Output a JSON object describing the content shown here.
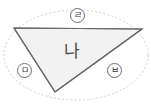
{
  "figure": {
    "type": "geometry-diagram",
    "background_color": "#ffffff",
    "center_label": "나",
    "triangle": {
      "fill_color": "#f2f2f2",
      "stroke_color": "#555555",
      "vertices": [
        {
          "name": "left-vertex",
          "x": 14,
          "y": 28
        },
        {
          "name": "right-vertex",
          "x": 142,
          "y": 29
        },
        {
          "name": "bottom-vertex",
          "x": 55,
          "y": 92
        }
      ]
    },
    "circumscribed_curve": {
      "shape": "ellipse",
      "style": "dotted",
      "stroke_color": "#cccccc",
      "center_x": 76,
      "center_y": 55,
      "radius_x": 72,
      "radius_y": 45
    },
    "labels": [
      {
        "id": "label-top",
        "text": "ㄹ",
        "position": "top",
        "x": 70,
        "y": 8
      },
      {
        "id": "label-left",
        "text": "ㅁ",
        "position": "left",
        "x": 17,
        "y": 63
      },
      {
        "id": "label-right",
        "text": "ㅂ",
        "position": "right",
        "x": 107,
        "y": 63
      }
    ]
  }
}
